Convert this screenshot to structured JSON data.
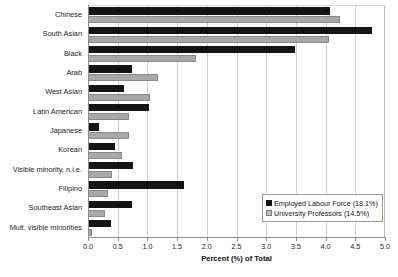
{
  "chart_data": {
    "type": "bar",
    "orientation": "horizontal",
    "title": "",
    "xlabel": "Percent (%) of Total",
    "ylabel": "",
    "xlim": [
      0.0,
      5.0
    ],
    "xticks": [
      "0.0",
      "0.5",
      "1.0",
      "1.5",
      "2.0",
      "2.5",
      "3.0",
      "3.5",
      "4.0",
      "4.5",
      "5.0"
    ],
    "grid": "vertical",
    "legend_position": "bottom-right",
    "categories": [
      "Chinese",
      "South Asian",
      "Black",
      "Arab",
      "West Asian",
      "Latin American",
      "Japanese",
      "Korean",
      "Visible minority, n.i.e.",
      "Filipino",
      "Southeast Asian",
      "Mult. visible minorities"
    ],
    "series": [
      {
        "name": "Employed Labour Force (18.1%)",
        "color": "#141414",
        "values": [
          4.08,
          4.78,
          3.49,
          0.74,
          0.61,
          1.03,
          0.19,
          0.46,
          0.76,
          1.61,
          0.74,
          0.39
        ]
      },
      {
        "name": "University Professors (14.5%)",
        "color": "#a8a8a8",
        "values": [
          4.24,
          4.05,
          1.81,
          1.18,
          1.05,
          0.69,
          0.69,
          0.58,
          0.4,
          0.33,
          0.28,
          0.07
        ]
      }
    ]
  },
  "legend": {
    "items": [
      {
        "label": "Employed Labour Force (18.1%)"
      },
      {
        "label": "University Professors (14.5%)"
      }
    ]
  }
}
